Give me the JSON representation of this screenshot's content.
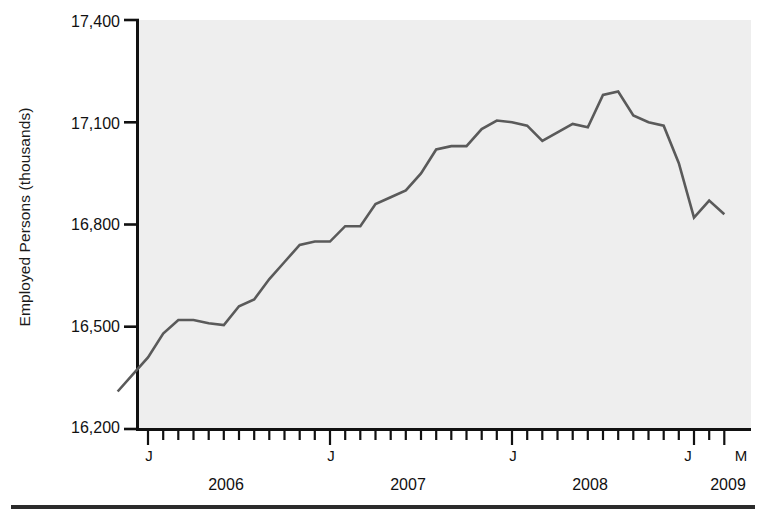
{
  "figure": {
    "background_color": "#ffffff",
    "plot_background_color": "#eeeeee",
    "line_color": "#5a5a5a",
    "axis_color": "#111111",
    "rule_color": "#2b2b2b"
  },
  "axes": {
    "y_axis_title": "Employed Persons (thousands)",
    "y_tick_labels": [
      "17,400",
      "17,100",
      "16,800",
      "16,500",
      "16,200"
    ],
    "y_tick_values": [
      17400,
      17100,
      16800,
      16500,
      16200
    ],
    "x_tick_labels": [
      "J",
      "J",
      "J",
      "J",
      "M"
    ],
    "x_year_labels": [
      "2006",
      "2007",
      "2008",
      "2009"
    ]
  },
  "chart_data": {
    "type": "line",
    "title": "",
    "subtitle": "",
    "xlabel": "",
    "ylabel": "Employed Persons (thousands)",
    "ylim": [
      16200,
      17400
    ],
    "grid": false,
    "legend": "none",
    "x_axis_type": "monthly",
    "x_start": "2005-11",
    "x_end": "2009-03",
    "x_major_ticks": [
      {
        "label": "J",
        "period": "2006-01"
      },
      {
        "label": "J",
        "period": "2007-01"
      },
      {
        "label": "J",
        "period": "2008-01"
      },
      {
        "label": "J",
        "period": "2009-01"
      },
      {
        "label": "M",
        "period": "2009-03"
      }
    ],
    "x_year_bands": [
      "2006",
      "2007",
      "2008",
      "2009"
    ],
    "x": [
      "2005-11",
      "2005-12",
      "2006-01",
      "2006-02",
      "2006-03",
      "2006-04",
      "2006-05",
      "2006-06",
      "2006-07",
      "2006-08",
      "2006-09",
      "2006-10",
      "2006-11",
      "2006-12",
      "2007-01",
      "2007-02",
      "2007-03",
      "2007-04",
      "2007-05",
      "2007-06",
      "2007-07",
      "2007-08",
      "2007-09",
      "2007-10",
      "2007-11",
      "2007-12",
      "2008-01",
      "2008-02",
      "2008-03",
      "2008-04",
      "2008-05",
      "2008-06",
      "2008-07",
      "2008-08",
      "2008-09",
      "2008-10",
      "2008-11",
      "2008-12",
      "2009-01",
      "2009-02",
      "2009-03"
    ],
    "series": [
      {
        "name": "Employed Persons",
        "values": [
          16310,
          16360,
          16410,
          16480,
          16520,
          16520,
          16510,
          16505,
          16560,
          16580,
          16640,
          16690,
          16740,
          16750,
          16750,
          16795,
          16795,
          16860,
          16880,
          16900,
          16950,
          17020,
          17030,
          17030,
          17080,
          17105,
          17100,
          17090,
          17045,
          17070,
          17095,
          17085,
          17180,
          17190,
          17120,
          17100,
          17090,
          16980,
          16820,
          16870,
          16830
        ]
      }
    ],
    "notes": {
      "peak_value": 17190,
      "peak_period": "2008-08",
      "start_value": 16310,
      "end_value": 16830,
      "min_value": 16310
    }
  }
}
